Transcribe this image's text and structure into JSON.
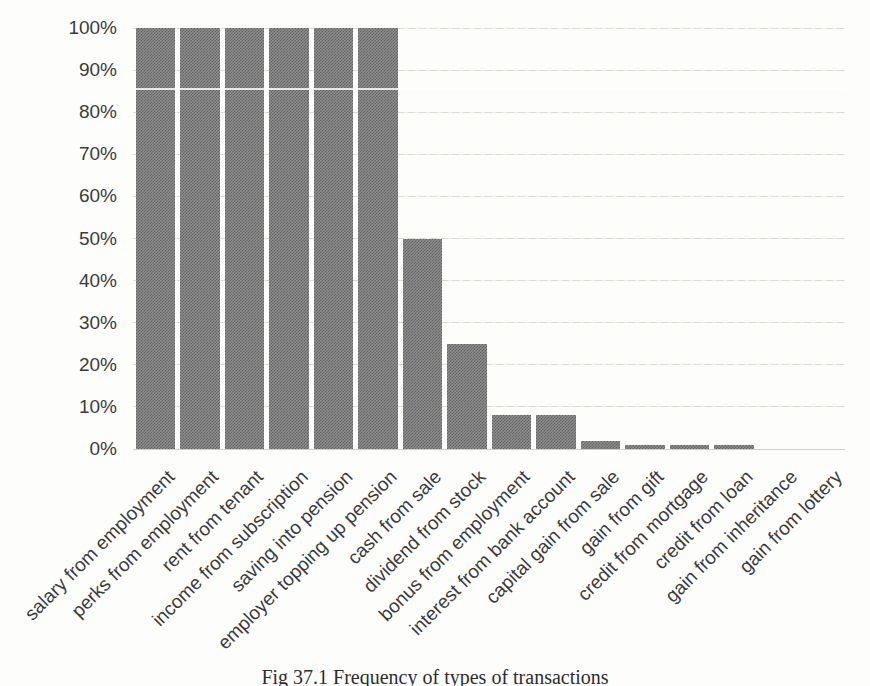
{
  "chart_data": {
    "type": "bar",
    "categories": [
      "salary from employment",
      "perks from employment",
      "rent from tenant",
      "income from subscription",
      "saving into pension",
      "employer topping up pension",
      "cash from sale",
      "dividend from stock",
      "bonus from employment",
      "interest from bank account",
      "capital gain from sale",
      "gain from gift",
      "credit from mortgage",
      "credit from loan",
      "gain from inheritance",
      "gain from lottery"
    ],
    "values": [
      100,
      100,
      100,
      100,
      100,
      100,
      50,
      25,
      8,
      8,
      2,
      1,
      1,
      1,
      0,
      0
    ],
    "title": "",
    "caption": "Fig 37.1 Frequency of types of transactions",
    "xlabel": "",
    "ylabel": "",
    "ylim": [
      0,
      100
    ],
    "ytick_step": 10,
    "ytick_labels": [
      "0%",
      "10%",
      "20%",
      "30%",
      "40%",
      "50%",
      "60%",
      "70%",
      "80%",
      "90%",
      "100%"
    ],
    "grid": true,
    "legend": false,
    "bar_color": "#7a7a7a",
    "bar_texture": "halftone-checkerboard",
    "gridline_color": "#ddd9d3",
    "axis_text_color": "#3b3b3b",
    "caption_color": "#2d2d2d"
  }
}
